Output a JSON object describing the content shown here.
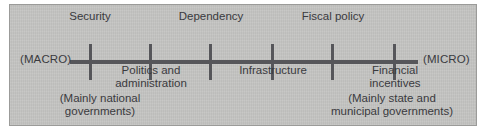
{
  "figure": {
    "type": "annotated-number-line",
    "panel_color": "#c3c3c1",
    "line_color": "#56565a",
    "text_color": "#3a3a3e",
    "left_endcap": "(MACRO)",
    "right_endcap": "(MICRO)",
    "axis": {
      "orientation": "horizontal",
      "tick_count": 6,
      "tick_positions_px": [
        90,
        150,
        210,
        272,
        332,
        394
      ],
      "line_start_px": 70,
      "line_end_px": 418
    },
    "ticks": [
      {
        "label": "Security",
        "placement": "above",
        "x": 90
      },
      {
        "label": "Politics and\nadministration",
        "placement": "below",
        "x": 150
      },
      {
        "label": "Dependency",
        "placement": "above",
        "x": 210
      },
      {
        "label": "Infrastructure",
        "placement": "below",
        "x": 272
      },
      {
        "label": "Fiscal policy",
        "placement": "above",
        "x": 332
      },
      {
        "label": "Financial\nincentives",
        "placement": "below",
        "x": 394
      }
    ],
    "labels": {
      "security": "Security",
      "politics_line1": "Politics and",
      "politics_line2": "administration",
      "dependency": "Dependency",
      "infrastructure": "Infrastructure",
      "fiscal_policy": "Fiscal policy",
      "financial_line1": "Financial",
      "financial_line2": "incentives"
    },
    "notes": {
      "left_line1": "(Mainly national",
      "left_line2": "governments)",
      "right_line1": "(Mainly state and",
      "right_line2": "municipal governments)"
    }
  }
}
